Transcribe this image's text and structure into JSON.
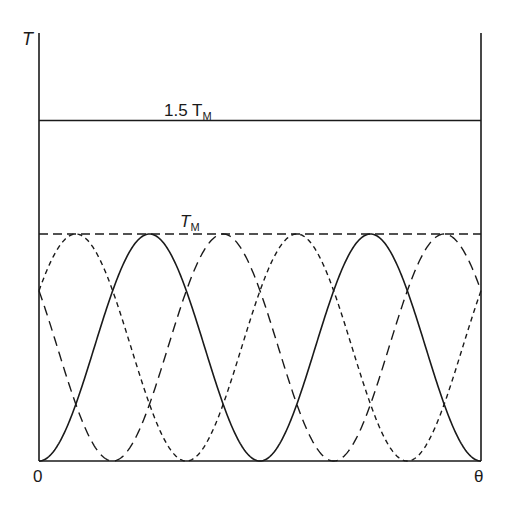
{
  "chart_data": {
    "type": "line",
    "title": "",
    "xlabel": "θ",
    "ylabel": "T",
    "x_tick_labels": [
      "0",
      "θ"
    ],
    "x_range": [
      0,
      2
    ],
    "x_unit_note": "x measured in electrical periods; 2 full periods of the solid curve span the axis",
    "ylim": [
      0,
      1.6
    ],
    "grid": false,
    "legend": null,
    "reference_lines": [
      {
        "name": "1.5 T_M",
        "value": 1.5,
        "style": "solid",
        "label": "1.5 T",
        "label_sub": "M"
      },
      {
        "name": "T_M",
        "value": 1.0,
        "style": "dashed",
        "label": "T",
        "label_sub": "M"
      }
    ],
    "series": [
      {
        "name": "phase A",
        "style": "solid",
        "formula": "T_M * sin^2(pi*x)",
        "phase_deg": 0,
        "x": [
          0,
          0.25,
          0.5,
          0.75,
          1.0,
          1.25,
          1.5,
          1.75,
          2.0
        ],
        "values": [
          0,
          0.5,
          1.0,
          0.5,
          0,
          0.5,
          1.0,
          0.5,
          0
        ]
      },
      {
        "name": "phase B",
        "style": "short-dash",
        "formula": "T_M * sin^2(pi*x + pi/3)",
        "phase_deg": 60,
        "x": [
          0,
          0.1667,
          0.6667,
          1.0,
          1.1667,
          1.6667,
          2.0
        ],
        "values": [
          0.75,
          1.0,
          0,
          0.75,
          1.0,
          0,
          0.75
        ]
      },
      {
        "name": "phase C",
        "style": "long-dash",
        "formula": "T_M * sin^2(pi*x - pi/3)",
        "phase_deg": -60,
        "x": [
          0,
          0.3333,
          0.8333,
          1.0,
          1.3333,
          1.8333,
          2.0
        ],
        "values": [
          0.75,
          0,
          1.0,
          0.75,
          0,
          1.0,
          0.75
        ]
      }
    ],
    "annotations": [
      "1.5 T_M",
      "T_M"
    ]
  },
  "labels": {
    "y_axis": "T",
    "x_origin": "0",
    "x_end": "θ",
    "ref_high_main": "1.5 T",
    "ref_high_sub": "M",
    "ref_tm_main": "T",
    "ref_tm_sub": "M"
  },
  "colors": {
    "ink": "#1a1a1a",
    "background": "#ffffff"
  }
}
